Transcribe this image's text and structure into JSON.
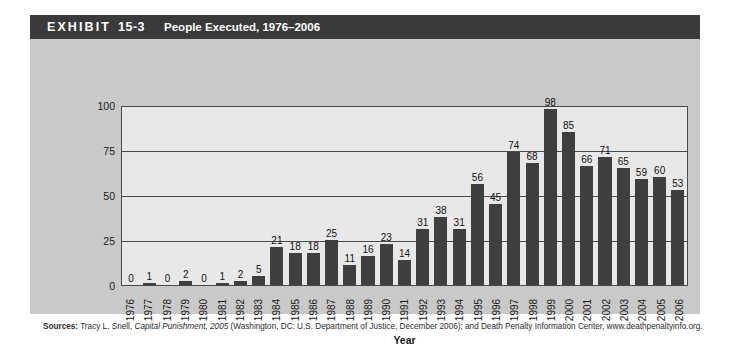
{
  "header": {
    "label": "EXHIBIT",
    "number": "15-3",
    "title": "People Executed, 1976–2006"
  },
  "source": {
    "label": "Sources:",
    "text_before_italic": " Tracy L. Snell, ",
    "italic_text": "Capital Punishment, 2005",
    "text_after_italic": " (Washington, DC: U.S. Department of Justice, December 2006); and Death Penalty Information Center, www.deathpenaltyinfo.org."
  },
  "colors": {
    "header_bar": "#3a3a3a",
    "panel_background": "#c9c9c9",
    "plot_background": "#e8e8e8",
    "bar_fill": "#3f3f3f",
    "axis_line": "#4a4a4a",
    "text": "#1a1a1a"
  },
  "chart_data": {
    "type": "bar",
    "title": "People Executed, 1976–2006",
    "xlabel": "Year",
    "ylabel": "Number of executions",
    "ylim": [
      0,
      100
    ],
    "yticks": [
      0,
      25,
      50,
      75,
      100
    ],
    "grid": true,
    "legend": "none",
    "categories": [
      "1976",
      "1977",
      "1978",
      "1979",
      "1980",
      "1981",
      "1982",
      "1983",
      "1984",
      "1985",
      "1986",
      "1987",
      "1988",
      "1989",
      "1990",
      "1991",
      "1992",
      "1993",
      "1994",
      "1995",
      "1996",
      "1997",
      "1998",
      "1999",
      "2000",
      "2001",
      "2002",
      "2003",
      "2004",
      "2005",
      "2006"
    ],
    "values": [
      0,
      1,
      0,
      2,
      0,
      1,
      2,
      5,
      21,
      18,
      18,
      25,
      11,
      16,
      23,
      14,
      31,
      38,
      31,
      56,
      45,
      74,
      68,
      98,
      85,
      66,
      71,
      65,
      59,
      60,
      53
    ]
  }
}
